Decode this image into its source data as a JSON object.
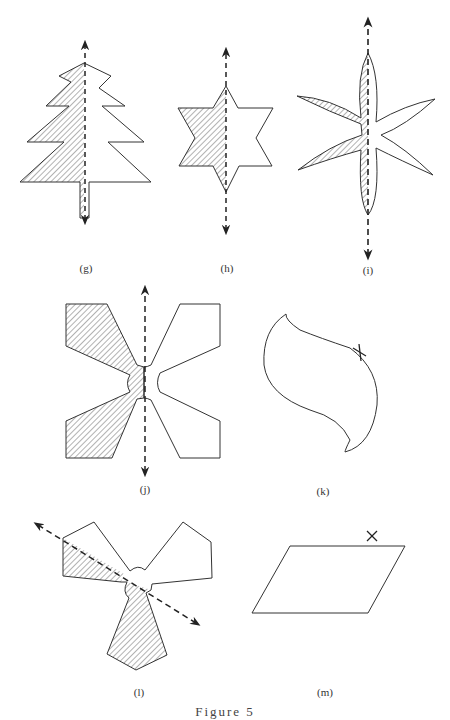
{
  "figure": {
    "caption": "Figure 5",
    "hatch_color": "#555555",
    "stroke_color": "#333333",
    "panels": [
      {
        "id": "g",
        "label": "(g)",
        "shape": "christmas-tree",
        "has_axis": true,
        "axis": "vertical",
        "half_shaded": "left"
      },
      {
        "id": "h",
        "label": "(h)",
        "shape": "six-point-star",
        "has_axis": true,
        "axis": "vertical",
        "half_shaded": "left"
      },
      {
        "id": "i",
        "label": "(i)",
        "shape": "six-petal-flower",
        "has_axis": true,
        "axis": "vertical",
        "half_shaded": "left"
      },
      {
        "id": "j",
        "label": "(j)",
        "shape": "four-blade-x",
        "has_axis": true,
        "axis": "vertical",
        "half_shaded": "left"
      },
      {
        "id": "k",
        "label": "(k)",
        "shape": "s-curve-blob",
        "has_axis": false,
        "marker": "×"
      },
      {
        "id": "l",
        "label": "(l)",
        "shape": "three-blade-propeller",
        "has_axis": true,
        "axis": "diagonal",
        "half_shaded": "lower-left"
      },
      {
        "id": "m",
        "label": "(m)",
        "shape": "parallelogram",
        "has_axis": false,
        "marker": "×"
      }
    ]
  }
}
